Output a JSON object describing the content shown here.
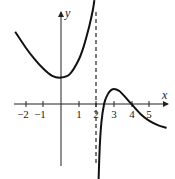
{
  "chart_data": {
    "type": "line",
    "title": "",
    "xlabel": "x",
    "ylabel": "y",
    "xlim": [
      -2.5,
      6.2
    ],
    "ylim": [
      -5.5,
      5.3
    ],
    "grid": false,
    "x_ticks": [
      -2,
      -1,
      1,
      2,
      3,
      4,
      5
    ],
    "x_tick_labels": [
      "−2",
      "−1",
      "1",
      "2",
      "3",
      "4",
      "5"
    ],
    "asymptotes": [
      {
        "type": "vertical",
        "x": 2,
        "style": "dashed"
      }
    ],
    "series": [
      {
        "name": "left branch",
        "x": [
          -2.6,
          -2,
          -1.5,
          -1,
          -0.5,
          0,
          0.5,
          1,
          1.3,
          1.6,
          1.8,
          1.9
        ],
        "y": [
          4.1,
          3.2,
          2.55,
          2.0,
          1.6,
          1.5,
          1.7,
          2.5,
          3.3,
          4.4,
          5.3,
          5.9
        ]
      },
      {
        "name": "right branch",
        "x": [
          2.1,
          2.2,
          2.3,
          2.45,
          2.6,
          2.8,
          3.0,
          3.3,
          3.6,
          4.0,
          4.5,
          5.0,
          5.5,
          6.0
        ],
        "y": [
          -5.4,
          -2.5,
          -1.0,
          0.0,
          0.45,
          0.75,
          0.85,
          0.75,
          0.45,
          0.0,
          -0.55,
          -0.95,
          -1.2,
          -1.35
        ]
      }
    ],
    "annotations": []
  },
  "labels": {
    "x_axis": "x",
    "y_axis": "y",
    "ticks": [
      "−2",
      "−1",
      "1",
      "2",
      "3",
      "4",
      "5"
    ]
  }
}
